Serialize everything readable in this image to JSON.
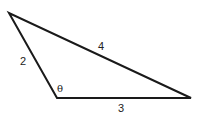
{
  "diagram": {
    "type": "triangle",
    "vertices": {
      "top_left": [
        9,
        13
      ],
      "bottom_left": [
        57,
        98
      ],
      "bottom_right": [
        191,
        98
      ]
    },
    "sides": [
      {
        "id": "left",
        "label": "2"
      },
      {
        "id": "top",
        "label": "4"
      },
      {
        "id": "bottom",
        "label": "3"
      }
    ],
    "angle_label": "θ",
    "stroke_color": "#1a1a1a",
    "background": "#ffffff"
  }
}
